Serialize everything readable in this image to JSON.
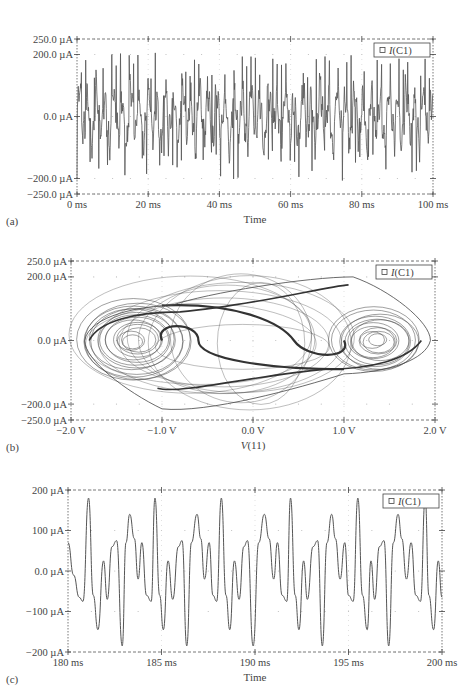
{
  "chart_data": [
    {
      "id": "a",
      "type": "line",
      "panel_label": "(a)",
      "title": "",
      "xlabel": "Time",
      "ylabel": "",
      "legend": [
        "I(C1)"
      ],
      "legend_position": "top-right",
      "grid": "dotted",
      "xlim": [
        0,
        100
      ],
      "ylim": [
        -250,
        250
      ],
      "x_unit": "ms",
      "y_unit": "µA",
      "x_ticks": [
        "0 ms",
        "20 ms",
        "40 ms",
        "60 ms",
        "80 ms",
        "100 ms"
      ],
      "y_ticks": [
        "250.0 µA",
        "200.0 µA",
        "0.0 µA",
        "−200.0 µA",
        "−250.0 µA"
      ],
      "series": [
        {
          "name": "I(C1)",
          "description": "chaotic oscillation, amplitude roughly ±200 µA, ~40 major spikes over 100 ms",
          "approx_peak_max": 210,
          "approx_peak_min": -230
        }
      ]
    },
    {
      "id": "b",
      "type": "line",
      "panel_label": "(b)",
      "title": "",
      "xlabel": "V(11)",
      "ylabel": "",
      "legend": [
        "I(C1)"
      ],
      "legend_position": "top-right",
      "grid": "dotted",
      "xlim": [
        -2.0,
        2.0
      ],
      "ylim": [
        -250,
        250
      ],
      "x_unit": "V",
      "y_unit": "µA",
      "x_ticks": [
        "−2.0 V",
        "−1.0 V",
        "0.0 V",
        "1.0 V",
        "2.0 V"
      ],
      "y_ticks": [
        "250.0 µA",
        "200.0 µA",
        "0.0 µA",
        "−200.0 µA",
        "−250.0 µA"
      ],
      "series": [
        {
          "name": "I(C1) vs V(11)",
          "description": "double-scroll chaotic attractor phase portrait with foci near V=−1.4 V and V=+1.3 V, extending from about −1.85 V to +1.95 V and −230 µA to +200 µA"
        }
      ]
    },
    {
      "id": "c",
      "type": "line",
      "panel_label": "(c)",
      "title": "",
      "xlabel": "Time",
      "ylabel": "",
      "legend": [
        "I(C1)"
      ],
      "legend_position": "top-right",
      "grid": "dotted",
      "xlim": [
        180,
        200
      ],
      "ylim": [
        -200,
        200
      ],
      "x_unit": "ms",
      "y_unit": "µA",
      "x_ticks": [
        "180 ms",
        "185 ms",
        "190 ms",
        "195 ms",
        "200 ms"
      ],
      "y_ticks": [
        "200 µA",
        "100 µA",
        "0.0 µA",
        "−100 µA",
        "−200 µA"
      ],
      "series": [
        {
          "name": "I(C1)",
          "x": [
            180.0,
            180.3,
            180.6,
            180.8,
            181.1,
            181.35,
            181.6,
            181.9,
            182.1,
            182.35,
            182.6,
            182.9,
            183.1,
            183.3,
            183.55,
            183.75,
            183.95,
            184.2,
            184.45,
            184.65,
            184.9,
            185.1,
            185.35,
            185.6,
            185.9,
            186.1,
            186.35,
            186.6,
            186.9,
            187.1,
            187.3,
            187.55,
            187.75,
            187.95,
            188.2,
            188.45,
            188.65,
            188.9,
            189.15,
            189.4,
            189.6,
            189.9,
            190.2,
            190.5,
            190.75,
            191.0,
            191.2,
            191.45,
            191.7,
            191.9,
            192.15,
            192.35,
            192.6,
            192.8,
            193.1,
            193.35,
            193.6,
            193.85,
            194.1,
            194.3,
            194.55,
            194.8,
            195.0,
            195.25,
            195.5,
            195.75,
            196.0,
            196.2,
            196.4,
            196.65,
            196.9,
            197.15,
            197.4,
            197.65,
            197.85,
            198.1,
            198.35,
            198.6,
            198.85,
            199.1,
            199.3,
            199.55,
            199.8,
            200.0
          ],
          "values": [
            70,
            -10,
            -65,
            -75,
            180,
            -60,
            -145,
            25,
            -70,
            60,
            75,
            -185,
            70,
            140,
            80,
            -20,
            70,
            -60,
            -75,
            180,
            -60,
            -145,
            25,
            -70,
            60,
            75,
            -185,
            70,
            140,
            80,
            -20,
            70,
            -60,
            -75,
            180,
            -60,
            -145,
            25,
            -70,
            60,
            75,
            -185,
            70,
            140,
            80,
            -20,
            70,
            -60,
            -75,
            180,
            -60,
            -145,
            25,
            -70,
            60,
            75,
            -185,
            70,
            140,
            80,
            -20,
            70,
            -60,
            -75,
            180,
            -60,
            -145,
            25,
            -70,
            60,
            75,
            -185,
            70,
            140,
            80,
            -20,
            70,
            -60,
            -75,
            180,
            -60,
            -145,
            25,
            -65
          ]
        }
      ]
    }
  ]
}
